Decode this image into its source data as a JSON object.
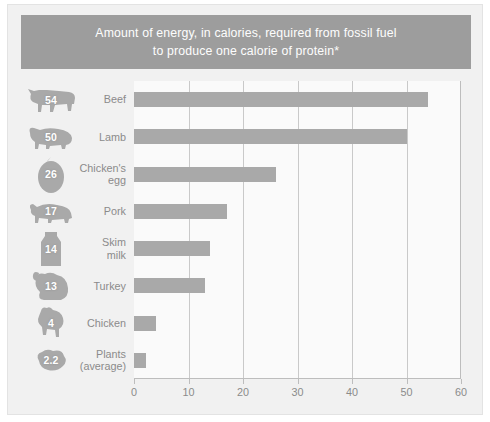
{
  "title": {
    "line1": "Amount of energy, in calories, required from fossil fuel",
    "line2": "to produce one calorie of protein*"
  },
  "colors": {
    "card_background": "#f1f1f1",
    "title_bar": "#9d9d9d",
    "title_text": "#fdfdfd",
    "bar": "#a9a9a9",
    "plot_background": "#fafafa",
    "gridline": "#c9c9c9",
    "axis": "#bdbdbd",
    "label_text": "#8b8b8b",
    "icon_fill": "#a9a9a9"
  },
  "chart_data": {
    "type": "bar",
    "orientation": "horizontal",
    "title": "Amount of energy, in calories, required from fossil fuel to produce one calorie of protein*",
    "xlabel": "",
    "ylabel": "",
    "xlim": [
      0,
      60
    ],
    "xticks": [
      "0",
      "10",
      "20",
      "30",
      "40",
      "50",
      "60"
    ],
    "grid": true,
    "legend": "none",
    "categories": [
      "Beef",
      "Lamb",
      "Chicken's egg",
      "Pork",
      "Skim milk",
      "Turkey",
      "Chicken",
      "Plants (average)"
    ],
    "values": [
      54,
      50,
      26,
      17,
      14,
      13,
      4,
      2.2
    ]
  },
  "rows": [
    {
      "label_line1": "Beef",
      "label_line2": "",
      "value": 54,
      "value_label": "54",
      "icon": "cow-icon"
    },
    {
      "label_line1": "Lamb",
      "label_line2": "",
      "value": 50,
      "value_label": "50",
      "icon": "sheep-icon"
    },
    {
      "label_line1": "Chicken's",
      "label_line2": "egg",
      "value": 26,
      "value_label": "26",
      "icon": "egg-icon"
    },
    {
      "label_line1": "Pork",
      "label_line2": "",
      "value": 17,
      "value_label": "17",
      "icon": "pig-icon"
    },
    {
      "label_line1": "Skim",
      "label_line2": "milk",
      "value": 14,
      "value_label": "14",
      "icon": "milk-carton-icon"
    },
    {
      "label_line1": "Turkey",
      "label_line2": "",
      "value": 13,
      "value_label": "13",
      "icon": "turkey-icon"
    },
    {
      "label_line1": "Chicken",
      "label_line2": "",
      "value": 4,
      "value_label": "4",
      "icon": "chicken-icon"
    },
    {
      "label_line1": "Plants",
      "label_line2": "(average)",
      "value": 2.2,
      "value_label": "2.2",
      "icon": "plant-icon"
    }
  ]
}
